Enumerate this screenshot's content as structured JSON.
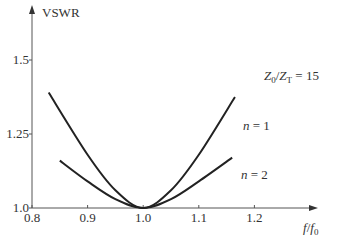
{
  "chart_data": {
    "type": "line",
    "title": "",
    "xlabel": "f/f0",
    "ylabel": "VSWR",
    "xlim": [
      0.8,
      1.25
    ],
    "ylim": [
      1.0,
      1.6
    ],
    "xticks": [
      "0.8",
      "0.9",
      "1.0",
      "1.1",
      "1.2"
    ],
    "yticks": [
      "1.0",
      "1.25",
      "1.5"
    ],
    "grid": false,
    "annotation": "Z0/ZT = 15",
    "series": [
      {
        "name": "n = 1",
        "x": [
          0.83,
          0.9,
          0.95,
          1.0,
          1.05,
          1.1,
          1.165
        ],
        "y": [
          1.39,
          1.18,
          1.06,
          1.0,
          1.06,
          1.18,
          1.375
        ]
      },
      {
        "name": "n = 2",
        "x": [
          0.85,
          0.9,
          0.95,
          1.0,
          1.05,
          1.1,
          1.16
        ],
        "y": [
          1.16,
          1.09,
          1.03,
          1.0,
          1.03,
          1.09,
          1.17
        ]
      }
    ]
  },
  "labels": {
    "ylabel": "VSWR",
    "xlabel_f": "f",
    "xlabel_sep": "/",
    "xlabel_f0": "f",
    "xlabel_sub": "0",
    "annotation": "Z0/ZT = 15",
    "n1": "n = 1",
    "n2": "n = 2"
  }
}
